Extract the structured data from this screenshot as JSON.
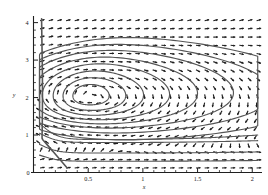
{
  "figure": {
    "title": "",
    "background_color": "#ffffff",
    "ink_color": "#1f1f1f",
    "streamline_color": "#555555"
  },
  "axes": {
    "x_label": "x",
    "y_label": "y",
    "x_ticks": [
      "0.5",
      "1",
      "1.5",
      "2"
    ],
    "y_ticks": [
      "0",
      "1",
      "2",
      "3",
      "4"
    ],
    "x_origin_label": "0",
    "x_range": [
      0,
      2.08
    ],
    "y_range": [
      0,
      4.15
    ],
    "x_minor_tick_count": 4,
    "y_minor_tick_count": 4
  },
  "chart_data": {
    "type": "scatter",
    "plot_kind": "vector-field-quiver-with-streamlines",
    "title": "",
    "xlabel": "x",
    "ylabel": "y",
    "xlim": [
      0,
      2.08
    ],
    "ylim": [
      0,
      4.15
    ],
    "grid": false,
    "legend": "none",
    "xticks": [
      0.5,
      1,
      1.5,
      2
    ],
    "yticks": [
      0,
      1,
      2,
      3,
      4
    ],
    "xticklabels": [
      "0.5",
      "1",
      "1.5",
      "2"
    ],
    "yticklabels": [
      "0",
      "1",
      "2",
      "3",
      "4"
    ],
    "annotations": [],
    "vortex": {
      "center_x": 0.52,
      "center_y": 2.05,
      "rotation": "counterclockwise",
      "note": "arrows point left along the top of the vortex and right along the bottom"
    },
    "quiver": {
      "nx": 26,
      "ny": 19,
      "x_start": 0.06,
      "x_end": 2.04,
      "y_start": 0.12,
      "y_end": 4.05,
      "arrow_scale": 0.075,
      "arrowhead_size": 1.9
    },
    "streamlines": {
      "count": 12,
      "closed_contour_levels": [
        0.08,
        0.18,
        0.3,
        0.44,
        0.58,
        0.72,
        0.85,
        0.94
      ],
      "open_lower_levels": [
        1.02,
        1.1,
        1.2
      ],
      "left_boundary_layer_x": 0.07,
      "note": "Inner contours are small ellipses about the vortex core; outer contours elongate toward large x and flatten near y=1; lowest curves are nearly horizontal lines crossing the full width."
    },
    "series": [
      {
        "name": "streamline-1-innermost",
        "kind": "closed-contour",
        "center": [
          0.52,
          2.05
        ],
        "rx": 0.16,
        "ry": 0.3
      },
      {
        "name": "streamline-2",
        "kind": "closed-contour",
        "center": [
          0.54,
          2.05
        ],
        "rx": 0.27,
        "ry": 0.48
      },
      {
        "name": "streamline-3",
        "kind": "closed-contour",
        "center": [
          0.56,
          2.06
        ],
        "rx": 0.38,
        "ry": 0.65
      },
      {
        "name": "streamline-4",
        "kind": "closed-contour",
        "center": [
          0.6,
          2.08
        ],
        "rx": 0.52,
        "ry": 0.82
      },
      {
        "name": "streamline-5",
        "kind": "closed-contour",
        "center": [
          0.64,
          2.1
        ],
        "rx": 0.66,
        "ry": 0.98
      },
      {
        "name": "streamline-6",
        "kind": "closed-contour",
        "center": [
          0.7,
          2.12
        ],
        "rx": 0.82,
        "ry": 1.14
      },
      {
        "name": "streamline-7",
        "kind": "closed-contour",
        "center": [
          0.76,
          2.12
        ],
        "rx": 0.98,
        "ry": 1.3
      },
      {
        "name": "streamline-8-outermost-closed",
        "kind": "closed-contour",
        "center": [
          0.85,
          2.1
        ],
        "rx": 1.15,
        "ry": 1.5
      },
      {
        "name": "streamline-9-lower-open",
        "kind": "open-curve",
        "y_at_left": 1.4,
        "y_plateau": 0.88,
        "y_at_right": 1.0
      },
      {
        "name": "streamline-10-lower-open",
        "kind": "open-curve",
        "y_at_left": 1.1,
        "y_plateau": 0.8,
        "y_at_right": 0.85
      },
      {
        "name": "streamline-11-lower-open",
        "kind": "open-curve",
        "y_at_left": 0.8,
        "y_plateau": 0.52,
        "y_at_right": 0.55
      },
      {
        "name": "streamline-12-lower-open",
        "kind": "open-curve",
        "y_at_left": 0.5,
        "y_plateau": 0.3,
        "y_at_right": 0.32
      }
    ]
  }
}
